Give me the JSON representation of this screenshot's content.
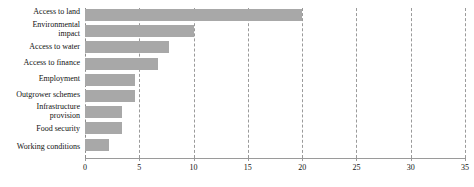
{
  "chart_data": {
    "type": "bar",
    "orientation": "horizontal",
    "title": "",
    "subtitle": "",
    "xlabel": "",
    "ylabel": "",
    "xlim": [
      0,
      35
    ],
    "xticks": [
      0,
      5,
      10,
      15,
      20,
      25,
      30,
      35
    ],
    "grid": true,
    "grid_axis": "x",
    "legend": false,
    "legend_position": "none",
    "bar_color": "#a8a8a8",
    "categories": [
      "Access to land",
      "Environmental\nimpact",
      "Access to water",
      "Access to finance",
      "Employment",
      "Outgrower schemes",
      "Infrastructure\nprovision",
      "Food security",
      "Working conditions"
    ],
    "values": [
      20,
      10,
      7.7,
      6.7,
      4.6,
      4.6,
      3.4,
      3.4,
      2.2
    ]
  }
}
